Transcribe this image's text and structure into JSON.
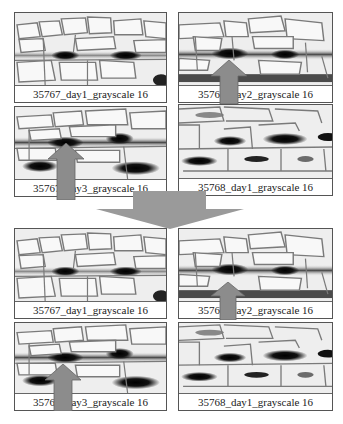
{
  "figure": {
    "arrow_color": "#8c8c8c",
    "cell_outline_color": "#7a7a7a"
  },
  "top_group": {
    "panels": [
      {
        "label": "35767_day1_grayscale 16",
        "has_arrow": false
      },
      {
        "label": "35767_day2_grayscale 16",
        "has_arrow": true
      },
      {
        "label": "35767_day3_grayscale 16",
        "has_arrow": true
      },
      {
        "label": "35768_day1_grayscale 16",
        "has_arrow": false
      }
    ]
  },
  "transition_arrow": {
    "direction": "down"
  },
  "bottom_group": {
    "panels": [
      {
        "label": "35767_day1_grayscale 16",
        "has_arrow": false
      },
      {
        "label": "35767_day2_grayscale 16",
        "has_arrow": true
      },
      {
        "label": "35767_day3_grayscale 16",
        "has_arrow": true
      },
      {
        "label": "35768_day1_grayscale 16",
        "has_arrow": false
      }
    ]
  }
}
